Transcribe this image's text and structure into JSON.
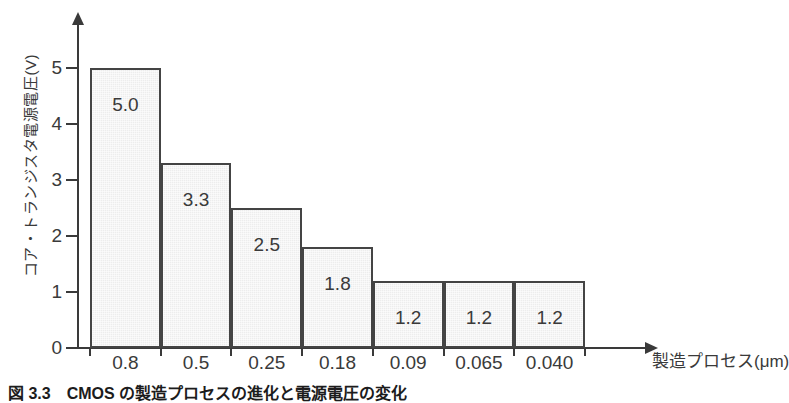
{
  "chart_data": {
    "type": "bar",
    "title": "",
    "xlabel": "製造プロセス(μm)",
    "ylabel": "コア・トランジスタ電源電圧(V)",
    "categories": [
      "0.8",
      "0.5",
      "0.25",
      "0.18",
      "0.09",
      "0.065",
      "0.040"
    ],
    "values": [
      5.0,
      3.3,
      2.5,
      1.8,
      1.2,
      1.2,
      1.2
    ],
    "data_labels": [
      "5.0",
      "3.3",
      "2.5",
      "1.8",
      "1.2",
      "1.2",
      "1.2"
    ],
    "ylim": [
      0,
      5.9
    ],
    "yticks": [
      "0",
      "1",
      "2",
      "3",
      "4",
      "5"
    ],
    "grid": false,
    "legend": false,
    "bar_fill": "#ededed",
    "bar_stroke": "#444444",
    "axis_color": "#3a3a3a",
    "background": "#ffffff"
  },
  "caption": {
    "text": "図 3.3　CMOS の製造プロセスの進化と電源電圧の変化"
  }
}
